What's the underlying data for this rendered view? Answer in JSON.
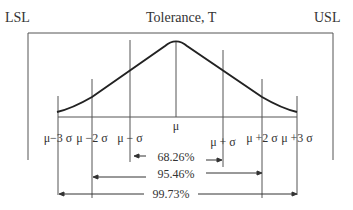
{
  "diagram": {
    "title": "Tolerance, T",
    "lsl_label": "LSL",
    "usl_label": "USL",
    "mean_label": "μ",
    "sigma_labels": {
      "minus3": "μ−3 σ",
      "minus2": "μ −2 σ",
      "minus1": "μ − σ",
      "plus1": "μ + σ",
      "plus2": "μ +2 σ",
      "plus3": "μ +3 σ"
    },
    "coverage": [
      {
        "range": "±1σ",
        "label": "68.26%"
      },
      {
        "range": "±2σ",
        "label": "95.46%"
      },
      {
        "range": "±3σ",
        "label": "99.73%"
      }
    ],
    "colors": {
      "line": "#333333",
      "thin": "#555555",
      "background": "#ffffff"
    }
  }
}
